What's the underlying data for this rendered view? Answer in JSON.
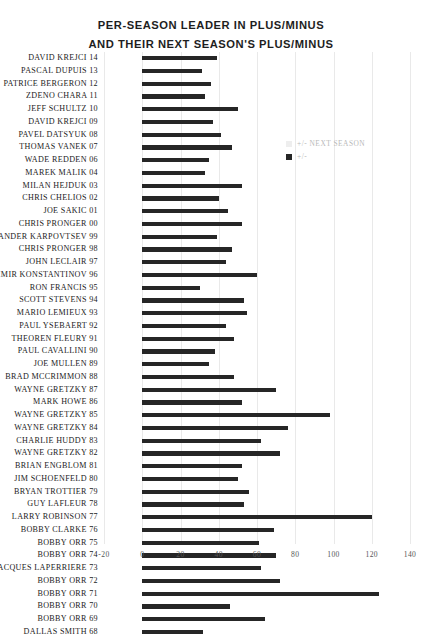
{
  "title": {
    "line1": "PER-SEASON LEADER IN PLUS/MINUS",
    "line2": "AND THEIR NEXT SEASON'S PLUS/MINUS"
  },
  "legend": {
    "position": "right-upper",
    "items": [
      {
        "label": "+/- NEXT SEASON",
        "color": "#eeeeee",
        "swatch": "next"
      },
      {
        "label": "+/-",
        "color": "#262626",
        "swatch": "cur"
      }
    ]
  },
  "chart_data": {
    "type": "bar",
    "orientation": "horizontal",
    "title": "PER-SEASON LEADER IN PLUS/MINUS AND THEIR NEXT SEASON'S PLUS/MINUS",
    "xlabel": "",
    "ylabel": "",
    "xlim": [
      -20,
      140
    ],
    "xticks": [
      -20,
      0,
      20,
      40,
      60,
      80,
      100,
      120,
      140
    ],
    "xtick_labels": [
      "-20",
      "0",
      "20",
      "40",
      "60",
      "80",
      "100",
      "120",
      "140"
    ],
    "grid": true,
    "grid_axis": "x",
    "legend_entries": [
      "+/- NEXT SEASON",
      "+/-"
    ],
    "categories": [
      "DAVID KREJCI 14",
      "PASCAL DUPUIS 13",
      "PATRICE BERGERON 12",
      "ZDENO CHARA 11",
      "JEFF SCHULTZ 10",
      "DAVID KREJCI 09",
      "PAVEL DATSYUK 08",
      "THOMAS VANEK 07",
      "WADE REDDEN 06",
      "MAREK MALIK 04",
      "MILAN HEJDUK 03",
      "CHRIS CHELIOS 02",
      "JOE SAKIC 01",
      "CHRIS PRONGER 00",
      "ALEXANDER KARPOVTSEV 99",
      "CHRIS PRONGER 98",
      "JOHN LECLAIR 97",
      "VLADIMIR KONSTANTINOV 96",
      "RON FRANCIS 95",
      "SCOTT STEVENS 94",
      "MARIO LEMIEUX 93",
      "PAUL YSEBAERT 92",
      "THEOREN FLEURY 91",
      "PAUL CAVALLINI 90",
      "JOE MULLEN 89",
      "BRAD MCCRIMMON 88",
      "WAYNE GRETZKY 87",
      "MARK HOWE 86",
      "WAYNE GRETZKY 85",
      "WAYNE GRETZKY 84",
      "CHARLIE HUDDY 83",
      "WAYNE GRETZKY 82",
      "BRIAN ENGBLOM 81",
      "JIM SCHOENFELD 80",
      "BRYAN TROTTIER 79",
      "GUY LAFLEUR 78",
      "LARRY ROBINSON 77",
      "BOBBY CLARKE 76",
      "BOBBY ORR 75",
      "BOBBY ORR 74",
      "JACQUES LAPERRIERE 73",
      "BOBBY ORR 72",
      "BOBBY ORR 71",
      "BOBBY ORR 70",
      "BOBBY ORR 69",
      "DALLAS SMITH 68"
    ],
    "series": [
      {
        "name": "+/-",
        "color": "#262626",
        "values": [
          39,
          31,
          36,
          33,
          50,
          37,
          41,
          47,
          35,
          33,
          52,
          40,
          45,
          52,
          39,
          47,
          44,
          60,
          30,
          53,
          55,
          44,
          48,
          38,
          35,
          48,
          70,
          52,
          98,
          76,
          62,
          72,
          52,
          50,
          56,
          53,
          120,
          69,
          61,
          70,
          62,
          72,
          124,
          46,
          64,
          32
        ]
      },
      {
        "name": "+/- NEXT SEASON",
        "color": "#eeeeee",
        "values": [
          null,
          null,
          null,
          null,
          null,
          null,
          null,
          null,
          null,
          null,
          null,
          null,
          null,
          null,
          null,
          null,
          null,
          null,
          null,
          null,
          null,
          null,
          null,
          null,
          null,
          null,
          null,
          null,
          null,
          null,
          null,
          null,
          null,
          null,
          null,
          null,
          null,
          null,
          null,
          null,
          null,
          null,
          null,
          null,
          null,
          null
        ]
      }
    ]
  }
}
